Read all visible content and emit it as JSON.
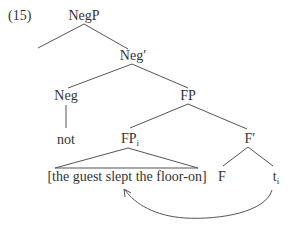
{
  "example_number": "(15)",
  "tree": {
    "negp": "NegP",
    "neg_bar": "Neg′",
    "neg": "Neg",
    "not": "not",
    "fp": "FP",
    "fp_i": {
      "label": "FP",
      "sub": "i"
    },
    "f_bar": "F′",
    "f": "F",
    "trace": {
      "label": "t",
      "sub": "i"
    },
    "clause": "[the guest slept the floor-on]"
  },
  "colors": {
    "line": "#555555",
    "text": "#333333"
  }
}
